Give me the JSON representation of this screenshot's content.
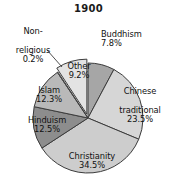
{
  "chart_data": {
    "type": "pie",
    "title": "1900",
    "subtitle": "",
    "xlabel": "",
    "ylabel": "",
    "legend": "none",
    "grid": false,
    "units": "percent",
    "start_angle_deg": 0,
    "direction": "clockwise",
    "categories": [
      "Buddhism",
      "Chinese traditional",
      "Christianity",
      "Hinduism",
      "Islam",
      "Non-religious",
      "Other"
    ],
    "values": [
      7.8,
      23.5,
      34.5,
      12.5,
      12.3,
      0.2,
      9.2
    ],
    "slices": [
      {
        "label": "Buddhism",
        "label_line1": "Buddhism",
        "value": 7.8,
        "value_text": "7.8%",
        "color": "#a6a6a6",
        "exploded": false,
        "label_outside": true
      },
      {
        "label": "Chinese traditional",
        "label_line1": "Chinese",
        "label_line2": "traditional",
        "value": 23.5,
        "value_text": "23.5%",
        "color": "#d6d6d6",
        "exploded": false,
        "label_outside": false
      },
      {
        "label": "Christianity",
        "label_line1": "Christianity",
        "value": 34.5,
        "value_text": "34.5%",
        "color": "#cdcdcd",
        "exploded": false,
        "label_outside": false
      },
      {
        "label": "Hinduism",
        "label_line1": "Hinduism",
        "value": 12.5,
        "value_text": "12.5%",
        "color": "#8d8d8d",
        "exploded": false,
        "label_outside": false
      },
      {
        "label": "Islam",
        "label_line1": "Islam",
        "value": 12.3,
        "value_text": "12.3%",
        "color": "#b9b9b9",
        "exploded": false,
        "label_outside": false
      },
      {
        "label": "Non-religious",
        "label_line1": "Non-",
        "label_line2": "religious",
        "value": 0.2,
        "value_text": "0.2%",
        "color": "#9a9a9a",
        "exploded": false,
        "label_outside": true
      },
      {
        "label": "Other",
        "label_line1": "Other",
        "value": 9.2,
        "value_text": "9.2%",
        "color": "#e3e3e3",
        "exploded": true,
        "label_outside": false
      }
    ],
    "colors": {
      "buddhism": "#a6a6a6",
      "chinese_traditional": "#d6d6d6",
      "christianity": "#cdcdcd",
      "hinduism": "#8d8d8d",
      "islam": "#b9b9b9",
      "non_religious": "#9a9a9a",
      "other": "#e3e3e3",
      "outline": "#3c3c3c",
      "background": "#ffffff",
      "text": "#111111"
    }
  }
}
